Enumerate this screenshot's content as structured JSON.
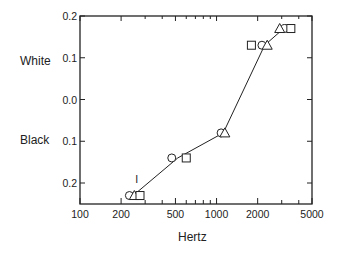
{
  "chart_data": {
    "type": "scatter",
    "title": "",
    "xlabel": "Hertz",
    "ylabel": "",
    "x_scale": "log",
    "xlim": [
      100,
      5000
    ],
    "x_ticks": [
      "100",
      "200",
      "500",
      "1000",
      "2000",
      "5000"
    ],
    "y_ticks": [
      "0.2",
      "0.1",
      "0.0",
      "0.1",
      "0.2"
    ],
    "y_side_labels": {
      "top": "White",
      "bottom": "Black"
    },
    "ylim": [
      -0.2,
      0.2
    ],
    "grid": false,
    "legend": null,
    "line": {
      "x": [
        245,
        520,
        1120,
        2250,
        3100
      ],
      "y": [
        -0.23,
        -0.14,
        -0.08,
        0.13,
        0.17
      ]
    },
    "series": [
      {
        "name": "circle",
        "marker": "circle",
        "x": [
          230,
          470,
          1080,
          2150,
          3150
        ],
        "y": [
          -0.23,
          -0.14,
          -0.08,
          0.13,
          0.17
        ]
      },
      {
        "name": "triangle",
        "marker": "triangle",
        "x": [
          250,
          1150,
          2350,
          2900
        ],
        "y": [
          -0.23,
          -0.08,
          0.13,
          0.17
        ]
      },
      {
        "name": "square",
        "marker": "square",
        "x": [
          275,
          600,
          1800,
          3500
        ],
        "y": [
          -0.23,
          -0.14,
          0.13,
          0.17
        ]
      }
    ],
    "annotations": [
      {
        "text": "I",
        "x": 260,
        "y": -0.2
      }
    ]
  },
  "labels": {
    "white": "White",
    "black": "Black",
    "xlabel": "Hertz"
  }
}
